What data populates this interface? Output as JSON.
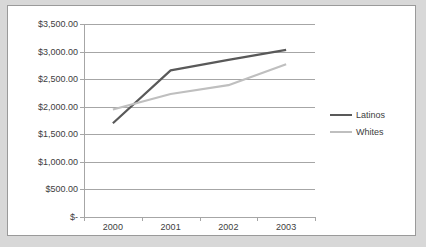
{
  "chart_data": {
    "type": "line",
    "title": "",
    "xlabel": "",
    "ylabel": "",
    "categories": [
      "2000",
      "2001",
      "2002",
      "2003"
    ],
    "series": [
      {
        "name": "Latinos",
        "color": "#595959",
        "values": [
          1700,
          2660,
          2850,
          3030
        ]
      },
      {
        "name": "Whites",
        "color": "#bfbfbf",
        "values": [
          1950,
          2230,
          2390,
          2770
        ]
      }
    ],
    "ylim": [
      0,
      3500
    ],
    "ytick_values": [
      3500,
      3000,
      2500,
      2000,
      1500,
      1000,
      500,
      0
    ],
    "ytick_labels": [
      "$3,500.00",
      "$3,000.00",
      "$2,500.00",
      "$2,000.00",
      "$1,500.00",
      "$1,000.00",
      "$500.00",
      "$-"
    ],
    "grid": true,
    "legend_position": "right",
    "plot_background": "#ffffff",
    "gridline_color": "#a6a6a6",
    "border_color": "#9a9a9a",
    "text_color": "#404040"
  },
  "legend": {
    "items": [
      {
        "label": "Latinos"
      },
      {
        "label": "Whites"
      }
    ]
  }
}
